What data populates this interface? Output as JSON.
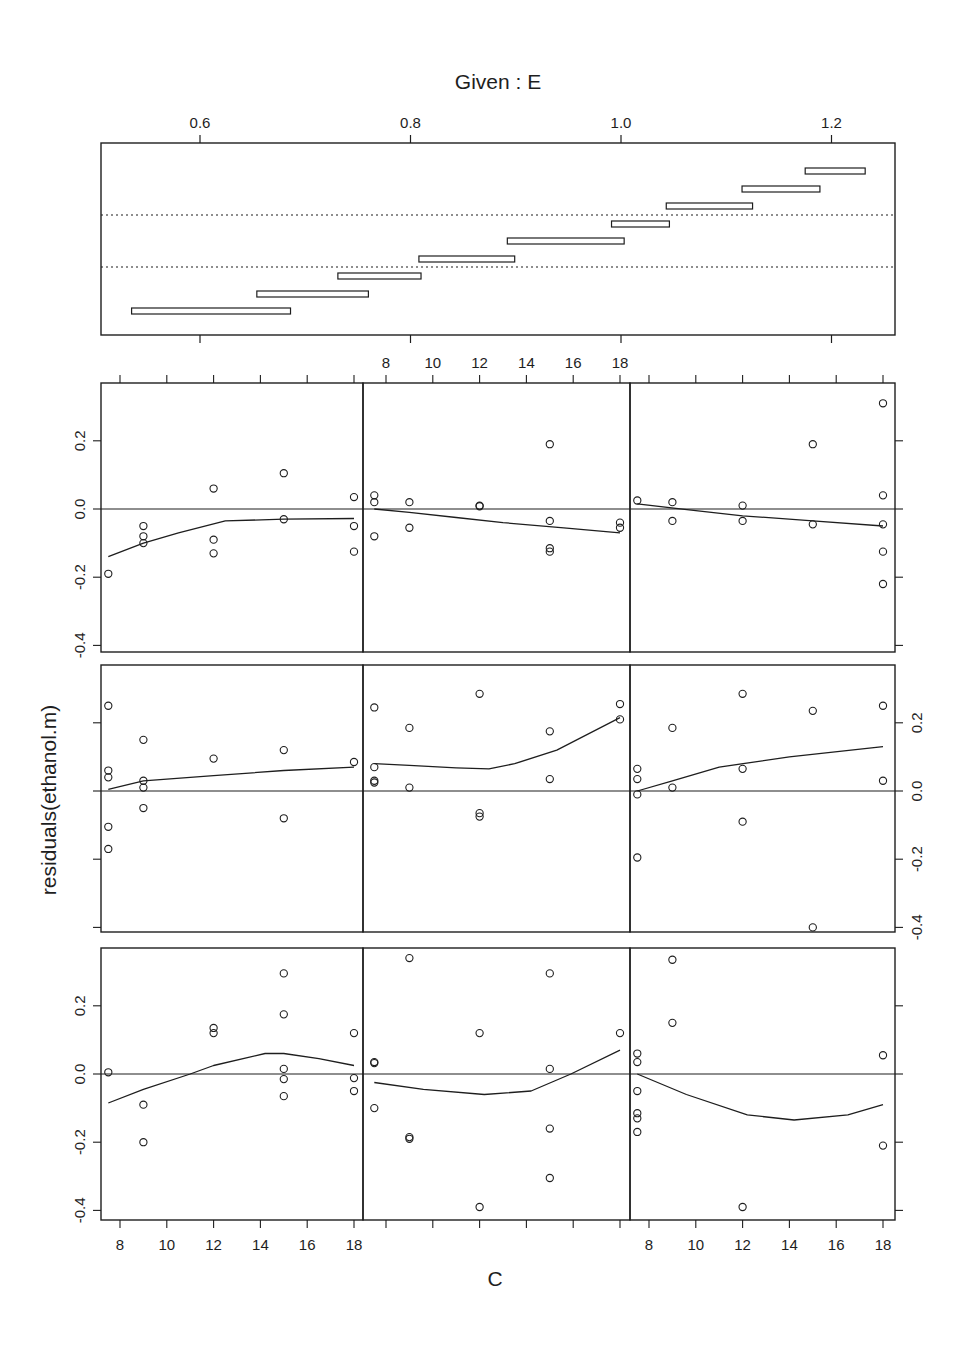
{
  "page": {
    "header_fragment_left": "",
    "header_fragment_right": ""
  },
  "chart_data": {
    "type": "scatter",
    "title": "Given : E",
    "xlabel": "C",
    "ylabel": "residuals(ethanol.m)",
    "given_panel": {
      "variable": "E",
      "xlim": [
        0.505,
        1.26
      ],
      "x_ticks": [
        0.6,
        0.8,
        1.0,
        1.2
      ],
      "x_tick_labels": [
        "0.6",
        "0.8",
        "1.0",
        "1.2"
      ],
      "intervals": [
        {
          "lo": 0.535,
          "hi": 0.686
        },
        {
          "lo": 0.654,
          "hi": 0.76
        },
        {
          "lo": 0.731,
          "hi": 0.81
        },
        {
          "lo": 0.808,
          "hi": 0.899
        },
        {
          "lo": 0.892,
          "hi": 1.003
        },
        {
          "lo": 0.991,
          "hi": 1.046
        },
        {
          "lo": 1.043,
          "hi": 1.125
        },
        {
          "lo": 1.115,
          "hi": 1.189
        },
        {
          "lo": 1.175,
          "hi": 1.232
        }
      ],
      "row_separators": [
        3,
        6
      ]
    },
    "panel_axes": {
      "xlim": [
        7.2,
        18.5
      ],
      "x_ticks": [
        8,
        10,
        12,
        14,
        16,
        18
      ],
      "x_tick_labels": [
        "8",
        "10",
        "12",
        "14",
        "16",
        "18"
      ],
      "ylim": [
        -0.42,
        0.365
      ],
      "y_ticks": [
        -0.4,
        -0.2,
        0.0,
        0.2
      ],
      "y_tick_labels": [
        "-0.4",
        "-0.2",
        "0.0",
        "0.2"
      ],
      "reference_line_y": 0.0,
      "grid": false
    },
    "panels": [
      {
        "row": 1,
        "col": 1,
        "given_interval": 7,
        "points": [
          [
            7.5,
            -0.19
          ],
          [
            9,
            -0.05
          ],
          [
            9,
            -0.08
          ],
          [
            9,
            -0.1
          ],
          [
            12,
            0.06
          ],
          [
            12,
            -0.09
          ],
          [
            12,
            -0.13
          ],
          [
            15,
            0.105
          ],
          [
            15,
            -0.03
          ],
          [
            18,
            0.035
          ],
          [
            18,
            -0.05
          ],
          [
            18,
            -0.125
          ]
        ],
        "smooth": [
          [
            7.5,
            -0.14
          ],
          [
            9,
            -0.1
          ],
          [
            10.5,
            -0.07
          ],
          [
            12.5,
            -0.035
          ],
          [
            15,
            -0.03
          ],
          [
            18,
            -0.028
          ]
        ]
      },
      {
        "row": 1,
        "col": 2,
        "given_interval": 8,
        "points": [
          [
            7.5,
            0.04
          ],
          [
            7.5,
            0.02
          ],
          [
            7.5,
            -0.08
          ],
          [
            9,
            0.02
          ],
          [
            9,
            -0.055
          ],
          [
            12,
            0.01
          ],
          [
            12,
            0.008
          ],
          [
            15,
            0.19
          ],
          [
            15,
            -0.035
          ],
          [
            15,
            -0.115
          ],
          [
            15,
            -0.125
          ],
          [
            18,
            -0.04
          ],
          [
            18,
            -0.055
          ]
        ],
        "smooth": [
          [
            7.5,
            0.0
          ],
          [
            9,
            -0.01
          ],
          [
            11,
            -0.025
          ],
          [
            13,
            -0.04
          ],
          [
            15.6,
            -0.055
          ],
          [
            18,
            -0.07
          ]
        ]
      },
      {
        "row": 1,
        "col": 3,
        "given_interval": 9,
        "points": [
          [
            7.5,
            0.025
          ],
          [
            9,
            0.02
          ],
          [
            9,
            -0.035
          ],
          [
            12,
            0.01
          ],
          [
            12,
            -0.035
          ],
          [
            15,
            0.19
          ],
          [
            15,
            -0.045
          ],
          [
            18,
            0.31
          ],
          [
            18,
            0.04
          ],
          [
            18,
            -0.045
          ],
          [
            18,
            -0.125
          ],
          [
            18,
            -0.22
          ]
        ],
        "smooth": [
          [
            7.5,
            0.015
          ],
          [
            10,
            -0.005
          ],
          [
            12,
            -0.02
          ],
          [
            15,
            -0.035
          ],
          [
            18,
            -0.05
          ]
        ]
      },
      {
        "row": 2,
        "col": 1,
        "given_interval": 4,
        "points": [
          [
            7.5,
            0.25
          ],
          [
            7.5,
            0.06
          ],
          [
            7.5,
            0.04
          ],
          [
            7.5,
            -0.105
          ],
          [
            7.5,
            -0.17
          ],
          [
            9,
            0.15
          ],
          [
            9,
            0.03
          ],
          [
            9,
            0.01
          ],
          [
            9,
            -0.05
          ],
          [
            12,
            0.095
          ],
          [
            15,
            0.12
          ],
          [
            15,
            -0.08
          ],
          [
            18,
            0.085
          ]
        ],
        "smooth": [
          [
            7.5,
            0.005
          ],
          [
            9,
            0.03
          ],
          [
            12,
            0.045
          ],
          [
            15,
            0.06
          ],
          [
            18,
            0.07
          ]
        ]
      },
      {
        "row": 2,
        "col": 2,
        "given_interval": 5,
        "points": [
          [
            7.5,
            0.245
          ],
          [
            7.5,
            0.07
          ],
          [
            7.5,
            0.03
          ],
          [
            7.5,
            0.025
          ],
          [
            9,
            0.185
          ],
          [
            9,
            0.01
          ],
          [
            12,
            0.285
          ],
          [
            12,
            -0.065
          ],
          [
            12,
            -0.075
          ],
          [
            15,
            0.175
          ],
          [
            15,
            0.035
          ],
          [
            18,
            0.255
          ],
          [
            18,
            0.21
          ]
        ],
        "smooth": [
          [
            7.5,
            0.08
          ],
          [
            9,
            0.075
          ],
          [
            11,
            0.068
          ],
          [
            12.4,
            0.065
          ],
          [
            13.5,
            0.08
          ],
          [
            15.3,
            0.12
          ],
          [
            18,
            0.215
          ]
        ]
      },
      {
        "row": 2,
        "col": 3,
        "given_interval": 6,
        "points": [
          [
            7.5,
            0.065
          ],
          [
            7.5,
            0.035
          ],
          [
            7.5,
            -0.01
          ],
          [
            7.5,
            -0.195
          ],
          [
            9,
            0.185
          ],
          [
            9,
            0.01
          ],
          [
            12,
            0.285
          ],
          [
            12,
            0.065
          ],
          [
            12,
            -0.09
          ],
          [
            15,
            0.235
          ],
          [
            15,
            -0.4
          ],
          [
            18,
            0.25
          ],
          [
            18,
            0.03
          ]
        ],
        "smooth": [
          [
            7.5,
            0.0
          ],
          [
            9,
            0.03
          ],
          [
            11,
            0.07
          ],
          [
            14,
            0.1
          ],
          [
            18,
            0.13
          ]
        ]
      },
      {
        "row": 3,
        "col": 1,
        "given_interval": 1,
        "points": [
          [
            7.5,
            0.005
          ],
          [
            9,
            -0.09
          ],
          [
            9,
            -0.2
          ],
          [
            12,
            0.135
          ],
          [
            12,
            0.12
          ],
          [
            15,
            0.295
          ],
          [
            15,
            0.175
          ],
          [
            15,
            0.015
          ],
          [
            15,
            -0.015
          ],
          [
            15,
            -0.065
          ],
          [
            18,
            0.12
          ],
          [
            18,
            -0.012
          ],
          [
            18,
            -0.05
          ]
        ],
        "smooth": [
          [
            7.5,
            -0.085
          ],
          [
            9,
            -0.045
          ],
          [
            11,
            0.0
          ],
          [
            12,
            0.025
          ],
          [
            14.2,
            0.06
          ],
          [
            15,
            0.06
          ],
          [
            16.5,
            0.045
          ],
          [
            18,
            0.025
          ]
        ]
      },
      {
        "row": 3,
        "col": 2,
        "given_interval": 2,
        "points": [
          [
            7.5,
            0.035
          ],
          [
            7.5,
            0.032
          ],
          [
            7.5,
            -0.1
          ],
          [
            9,
            0.34
          ],
          [
            9,
            -0.185
          ],
          [
            9,
            -0.19
          ],
          [
            12,
            0.12
          ],
          [
            12,
            -0.39
          ],
          [
            15,
            0.295
          ],
          [
            15,
            0.015
          ],
          [
            15,
            -0.16
          ],
          [
            15,
            -0.305
          ],
          [
            18,
            0.12
          ]
        ],
        "smooth": [
          [
            7.5,
            -0.025
          ],
          [
            9.6,
            -0.045
          ],
          [
            12.2,
            -0.06
          ],
          [
            14.2,
            -0.05
          ],
          [
            15.9,
            0.0
          ],
          [
            18,
            0.07
          ]
        ]
      },
      {
        "row": 3,
        "col": 3,
        "given_interval": 3,
        "points": [
          [
            7.5,
            0.06
          ],
          [
            7.5,
            0.035
          ],
          [
            7.5,
            -0.05
          ],
          [
            7.5,
            -0.115
          ],
          [
            7.5,
            -0.13
          ],
          [
            7.5,
            -0.17
          ],
          [
            9,
            0.335
          ],
          [
            9,
            0.15
          ],
          [
            12,
            -0.39
          ],
          [
            18,
            0.055
          ],
          [
            18,
            -0.21
          ]
        ],
        "smooth": [
          [
            7.5,
            0.0
          ],
          [
            9.6,
            -0.06
          ],
          [
            12.2,
            -0.12
          ],
          [
            14.2,
            -0.135
          ],
          [
            16.5,
            -0.12
          ],
          [
            18,
            -0.09
          ]
        ]
      }
    ],
    "axis_label_positions": {
      "top_x_axis_on_cols": [
        2
      ],
      "bottom_x_axis_on_cols": [
        1,
        3
      ],
      "left_y_axis_on_rows": [
        1,
        3
      ],
      "right_y_axis_on_rows": [
        2
      ]
    }
  },
  "layout": {
    "given_box": {
      "x0": 101,
      "x1": 895,
      "y0": 143,
      "y1": 335
    },
    "given_interval_y": [
      311,
      294,
      276,
      259,
      241,
      224,
      206,
      189,
      171
    ],
    "given_sep_y": [
      215,
      267
    ],
    "col_bounds": [
      [
        101,
        363
      ],
      [
        363,
        630
      ],
      [
        630,
        895
      ]
    ],
    "row_bounds": [
      [
        383,
        652
      ],
      [
        665,
        932
      ],
      [
        948,
        1220
      ]
    ],
    "zero_y": [
      509,
      791,
      1074
    ],
    "px_per_unit_y": 341,
    "x8_per_col": [
      120,
      386,
      649
    ],
    "px_per_unit_x": 23.4
  },
  "colors": {
    "ink": "#1e1e1e",
    "background": "#ffffff"
  }
}
